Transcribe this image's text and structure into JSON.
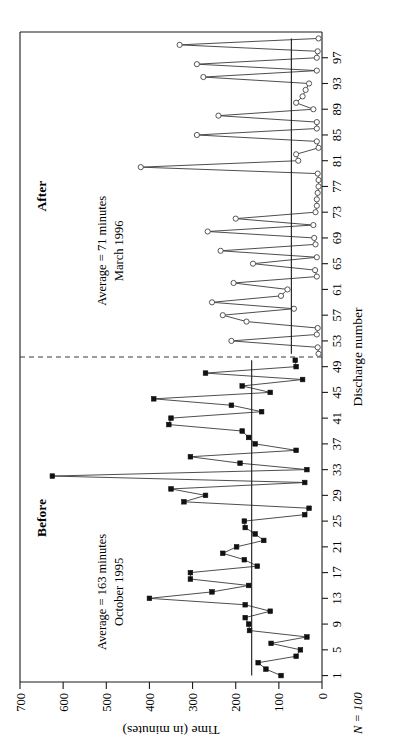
{
  "figure": {
    "n_label": "N = 100",
    "divider_at": 50.5
  },
  "chart_data": {
    "type": "line",
    "title": "",
    "subtitle": "",
    "xlabel": "Discharge number",
    "ylabel": "Time (in minutes)",
    "xlim": [
      0,
      101
    ],
    "ylim": [
      0,
      700
    ],
    "grid": false,
    "legend": "none",
    "xticks": [
      1,
      5,
      9,
      13,
      17,
      21,
      25,
      29,
      33,
      37,
      41,
      45,
      49,
      53,
      57,
      61,
      65,
      69,
      73,
      77,
      81,
      85,
      89,
      93,
      97
    ],
    "yticks": [
      0,
      100,
      200,
      300,
      400,
      500,
      600,
      700
    ],
    "annotations": [
      {
        "id": "before",
        "phase_label": "Before",
        "average_text": "Average = 163 minutes",
        "period_text": "October 1995",
        "mean_value": 163,
        "mean_from_x": 1,
        "mean_to_x": 50
      },
      {
        "id": "after",
        "phase_label": "After",
        "average_text": "Average = 71 minutes",
        "period_text": "March 1996",
        "mean_value": 71,
        "mean_from_x": 51,
        "mean_to_x": 100
      }
    ],
    "series": [
      {
        "name": "Before",
        "marker": "filled-square",
        "x": [
          1,
          2,
          3,
          4,
          5,
          6,
          7,
          8,
          9,
          10,
          11,
          12,
          13,
          14,
          15,
          16,
          17,
          18,
          19,
          20,
          21,
          22,
          23,
          24,
          25,
          26,
          27,
          28,
          29,
          30,
          31,
          32,
          33,
          34,
          35,
          36,
          37,
          38,
          39,
          40,
          41,
          42,
          43,
          44,
          45,
          46,
          47,
          48,
          49,
          50
        ],
        "values": [
          95,
          130,
          148,
          60,
          50,
          118,
          35,
          168,
          170,
          178,
          120,
          178,
          400,
          255,
          170,
          305,
          305,
          150,
          180,
          230,
          198,
          135,
          155,
          178,
          180,
          40,
          30,
          320,
          270,
          350,
          40,
          625,
          35,
          190,
          305,
          60,
          155,
          170,
          185,
          355,
          350,
          140,
          210,
          390,
          120,
          185,
          45,
          270,
          60,
          62
        ]
      },
      {
        "name": "After",
        "marker": "open-circle",
        "x": [
          51,
          52,
          53,
          54,
          55,
          56,
          57,
          58,
          59,
          60,
          61,
          62,
          63,
          64,
          65,
          66,
          67,
          68,
          69,
          70,
          71,
          72,
          73,
          74,
          75,
          76,
          77,
          78,
          79,
          80,
          81,
          82,
          83,
          84,
          85,
          86,
          87,
          88,
          89,
          90,
          91,
          92,
          93,
          94,
          95,
          96,
          97,
          98,
          99,
          100
        ],
        "values": [
          8,
          10,
          210,
          12,
          10,
          175,
          230,
          65,
          255,
          95,
          80,
          205,
          12,
          16,
          160,
          12,
          235,
          15,
          18,
          265,
          20,
          200,
          15,
          12,
          12,
          10,
          8,
          8,
          10,
          420,
          55,
          60,
          8,
          12,
          290,
          12,
          12,
          240,
          20,
          60,
          45,
          38,
          30,
          275,
          12,
          290,
          12,
          10,
          330,
          8
        ]
      }
    ]
  }
}
